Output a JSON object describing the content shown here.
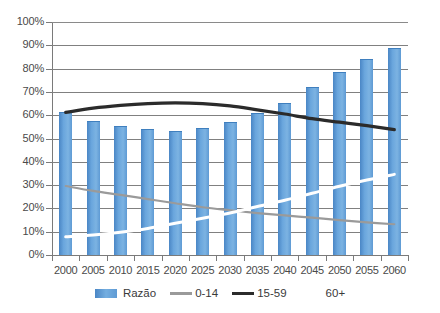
{
  "chart_data": {
    "type": "bar",
    "title": "",
    "xlabel": "",
    "ylabel": "",
    "ylim": [
      0,
      100
    ],
    "ytick_labels": [
      "100%",
      "90%",
      "80%",
      "70%",
      "60%",
      "50%",
      "40%",
      "30%",
      "20%",
      "10%",
      "0%"
    ],
    "ytick_values": [
      100,
      90,
      80,
      70,
      60,
      50,
      40,
      30,
      20,
      10,
      0
    ],
    "grid": true,
    "legend_position": "bottom",
    "categories": [
      "2000",
      "2005",
      "2010",
      "2015",
      "2020",
      "2025",
      "2030",
      "2035",
      "2040",
      "2045",
      "2050",
      "2055",
      "2060"
    ],
    "series": [
      {
        "name": "Razão",
        "render": "bar",
        "color": "#5B9BD5",
        "values": [
          61,
          57,
          55,
          53.5,
          52.8,
          54.2,
          56.8,
          60.5,
          65,
          71.5,
          78,
          83.5,
          88.5
        ]
      },
      {
        "name": "0-14",
        "render": "line",
        "color": "#9A9A9A",
        "values": [
          29.6,
          27.5,
          25.8,
          24,
          22.2,
          20.5,
          19.2,
          18,
          17,
          16,
          15,
          14,
          13.2
        ]
      },
      {
        "name": "15-59",
        "render": "line",
        "color": "#2B2B2B",
        "values": [
          61.2,
          63,
          64.2,
          65,
          65.3,
          65,
          64,
          62.3,
          60.5,
          58.5,
          57,
          55.5,
          53.8
        ]
      },
      {
        "name": "60+",
        "render": "line",
        "color": "#FFFFFF",
        "values": [
          7.8,
          8.6,
          9.8,
          11.4,
          13.6,
          15.8,
          18,
          20.8,
          23.5,
          26.5,
          29.5,
          32.2,
          34.6
        ]
      }
    ]
  },
  "legend": {
    "items": [
      {
        "label": "Razão",
        "swatch": "bar",
        "color": "#5B9BD5"
      },
      {
        "label": "0-14",
        "swatch": "line",
        "color": "#9A9A9A"
      },
      {
        "label": "15-59",
        "swatch": "line-dark",
        "color": "#2B2B2B"
      },
      {
        "label": "60+",
        "swatch": "line-white",
        "color": "#FFFFFF"
      }
    ]
  }
}
